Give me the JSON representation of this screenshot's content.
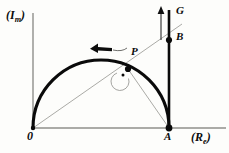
{
  "figure": {
    "background_color": "#fdfdfb",
    "axis_color": "#8b8b87",
    "curve_color": "#0a0a0a",
    "thin_line_color": "#9a9a96",
    "labels": {
      "y_axis": "(I",
      "y_axis_sub": "m",
      "y_axis_close": ")",
      "x_axis": "(R",
      "x_axis_sub": "e",
      "x_axis_close": ")",
      "origin": "0",
      "point_a": "A",
      "point_p": "P",
      "point_b": "B",
      "vector_g": "G"
    },
    "geometry": {
      "origin": [
        33,
        128
      ],
      "point_a": [
        169,
        128
      ],
      "point_p": [
        128,
        69
      ],
      "point_b": [
        169,
        40
      ],
      "semicircle_center": [
        101,
        128
      ],
      "semicircle_radius": 68,
      "y_axis_top": 13,
      "x_axis_right": 226,
      "vertical_line_top": 10,
      "g_arrow_x": 161,
      "g_arrow_top": 8,
      "g_arrow_bottom": 40,
      "direction_arrow": "counterclockwise",
      "right_angle_at": "P"
    }
  }
}
